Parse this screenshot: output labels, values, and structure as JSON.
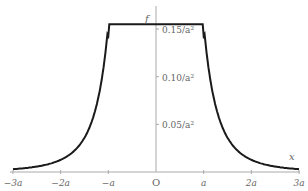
{
  "chart_data": {
    "type": "line",
    "title": "",
    "xlabel": "x",
    "ylabel": "f",
    "origin_label": "O",
    "x_ticks": [
      {
        "value": -3,
        "label": "−3a"
      },
      {
        "value": -2,
        "label": "−2a"
      },
      {
        "value": -1,
        "label": "−a"
      },
      {
        "value": 1,
        "label": "a"
      },
      {
        "value": 2,
        "label": "2a"
      },
      {
        "value": 3,
        "label": "3a"
      }
    ],
    "y_ticks": [
      {
        "value": 0.05,
        "label": "0.05/a²"
      },
      {
        "value": 0.1,
        "label": "0.10/a²"
      },
      {
        "value": 0.15,
        "label": "0.15/a²"
      }
    ],
    "xlim": [
      -3,
      3
    ],
    "ylim": [
      0,
      0.16
    ],
    "grid": false,
    "legend": null,
    "x_units": "a",
    "y_units": "1/a^2",
    "series": [
      {
        "name": "f(x)",
        "description": "Constant plateau of 0.15/a^2 for |x| <= a, decaying as 0.15 a^2 / x^4-like tail outside",
        "x": [
          -3,
          -2.5,
          -2,
          -1.75,
          -1.5,
          -1.25,
          -1.0,
          -1.0,
          -0.5,
          0,
          0.5,
          1.0,
          1.0,
          1.25,
          1.5,
          1.75,
          2,
          2.5,
          3
        ],
        "y": [
          0.003,
          0.006,
          0.011,
          0.017,
          0.027,
          0.055,
          0.14,
          0.155,
          0.155,
          0.155,
          0.155,
          0.155,
          0.14,
          0.055,
          0.027,
          0.017,
          0.011,
          0.006,
          0.003
        ]
      }
    ],
    "colors": {
      "curve": "#1a1a1a",
      "axis": "#999999",
      "text": "#666666"
    }
  }
}
